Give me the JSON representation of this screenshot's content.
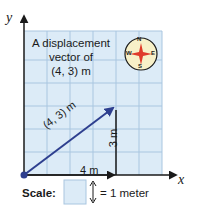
{
  "title": {
    "line1": "A displacement",
    "line2": "vector of",
    "line3": "(4, 3) m"
  },
  "axes": {
    "x": "x",
    "y": "y"
  },
  "compass": {
    "n": "N",
    "s": "S",
    "e": "E",
    "w": "W"
  },
  "vector": {
    "label": "(4, 3) m",
    "components": [
      4,
      3
    ]
  },
  "components": {
    "horizontal": "4 m",
    "vertical": "3 m"
  },
  "scale": {
    "label": "Scale:",
    "equals": "= 1 meter"
  },
  "colors": {
    "grid_fill": "#dcebf7",
    "grid_line": "#a9c6e0",
    "vector": "#2e3f8f",
    "axis": "#1a1a1a",
    "compass_fill": "#f7f0c8",
    "compass_star": "#e03a2a"
  }
}
